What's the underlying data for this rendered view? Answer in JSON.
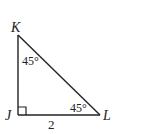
{
  "diagram": {
    "type": "right-triangle",
    "vertices": {
      "top": "K",
      "right_angle": "J",
      "right": "L"
    },
    "angles": {
      "at_K": "45°",
      "at_L": "45°",
      "at_J": "right-angle"
    },
    "side_JL_length": "2"
  }
}
